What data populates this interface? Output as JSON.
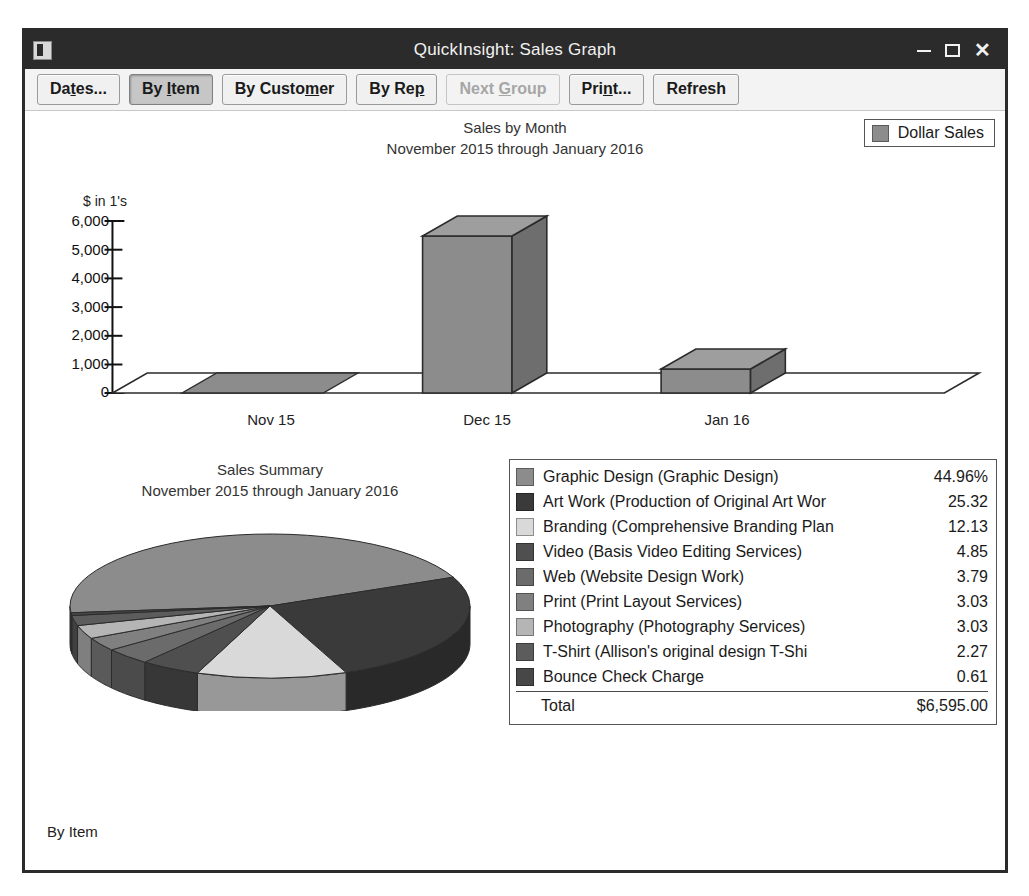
{
  "window": {
    "title": "QuickInsight: Sales Graph",
    "icon": "app-icon",
    "minimize": "—",
    "maximize": "□",
    "close": "✕"
  },
  "toolbar": {
    "buttons": [
      {
        "id": "dates",
        "label": "Dates...",
        "pre": "Da",
        "accel": "t",
        "post": "es...",
        "state": "normal"
      },
      {
        "id": "by-item",
        "label": "By Item",
        "pre": "By ",
        "accel": "I",
        "post": "tem",
        "state": "active"
      },
      {
        "id": "by-customer",
        "label": "By Customer",
        "pre": "By Custo",
        "accel": "m",
        "post": "er",
        "state": "normal"
      },
      {
        "id": "by-rep",
        "label": "By Rep",
        "pre": "By Re",
        "accel": "p",
        "post": "",
        "state": "normal"
      },
      {
        "id": "next-group",
        "label": "Next Group",
        "pre": "Next ",
        "accel": "G",
        "post": "roup",
        "state": "disabled"
      },
      {
        "id": "print",
        "label": "Print...",
        "pre": "Pri",
        "accel": "n",
        "post": "t...",
        "state": "normal"
      },
      {
        "id": "refresh",
        "label": "Refresh",
        "pre": "Refresh",
        "accel": "",
        "post": "",
        "state": "normal"
      }
    ]
  },
  "bar_chart": {
    "title_line1": "Sales by Month",
    "title_line2": "November 2015 through January 2016",
    "legend_label": "Dollar Sales",
    "legend_color": "#8c8c8c",
    "axis_caption": "$ in 1's"
  },
  "pie_chart": {
    "title_line1": "Sales Summary",
    "title_line2": "November 2015 through January 2016",
    "total_label": "Total",
    "total_value": "$6,595.00"
  },
  "status": {
    "text": "By Item"
  },
  "chart_data": [
    {
      "type": "bar",
      "title": "Sales by Month",
      "subtitle": "November 2015 through January 2016",
      "xlabel": "",
      "ylabel": "$ in 1's",
      "categories": [
        "Nov 15",
        "Dec 15",
        "Jan 16"
      ],
      "tick_labels": [
        "0",
        "1,000",
        "2,000",
        "3,000",
        "4,000",
        "5,000",
        "6,000"
      ],
      "ylim": [
        0,
        6000
      ],
      "grid": false,
      "legend_position": "top-right",
      "series": [
        {
          "name": "Dollar Sales",
          "color": "#8c8c8c",
          "values": [
            40,
            5500,
            900
          ]
        }
      ]
    },
    {
      "type": "pie",
      "title": "Sales Summary",
      "subtitle": "November 2015 through January 2016",
      "legend_position": "right",
      "total_label": "Total",
      "total_value": "$6,595.00",
      "slices": [
        {
          "label": "Graphic Design (Graphic Design)",
          "value": 44.96,
          "display": "44.96%",
          "color": "#8c8c8c"
        },
        {
          "label": "Art Work (Production of Original Art Wor",
          "value": 25.32,
          "display": "25.32",
          "color": "#3a3a3a"
        },
        {
          "label": "Branding (Comprehensive Branding Plan",
          "value": 12.13,
          "display": "12.13",
          "color": "#d9d9d9"
        },
        {
          "label": "Video (Basis Video Editing Services)",
          "value": 4.85,
          "display": "4.85",
          "color": "#4f4f4f"
        },
        {
          "label": "Web (Website Design Work)",
          "value": 3.79,
          "display": "3.79",
          "color": "#6b6b6b"
        },
        {
          "label": "Print (Print Layout Services)",
          "value": 3.03,
          "display": "3.03",
          "color": "#808080"
        },
        {
          "label": "Photography (Photography Services)",
          "value": 3.03,
          "display": "3.03",
          "color": "#b5b5b5"
        },
        {
          "label": "T-Shirt (Allison's original design T-Shi",
          "value": 2.27,
          "display": "2.27",
          "color": "#5c5c5c"
        },
        {
          "label": "Bounce Check Charge",
          "value": 0.61,
          "display": "0.61",
          "color": "#474747"
        }
      ]
    }
  ]
}
